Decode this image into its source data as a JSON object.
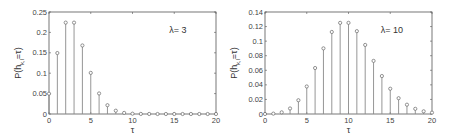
{
  "chart_data": [
    {
      "type": "stem",
      "title": "",
      "annotation": "λ= 3",
      "xlabel": "τ",
      "ylabel": "P(h_{k,l}=τ)",
      "ylabel_main": "P(h",
      "ylabel_sub": "k,l",
      "ylabel_tail": "=τ)",
      "xlim": [
        0,
        20
      ],
      "ylim": [
        0,
        0.25
      ],
      "xticks": [
        0,
        5,
        10,
        15,
        20
      ],
      "xtick_labels": [
        "0",
        "5",
        "10",
        "15",
        "20"
      ],
      "yticks": [
        0,
        0.05,
        0.1,
        0.15,
        0.2,
        0.25
      ],
      "ytick_labels": [
        "0",
        "0.05",
        "0.1",
        "0.15",
        "0.2",
        "0.25"
      ],
      "grid": false,
      "x": [
        0,
        1,
        2,
        3,
        4,
        5,
        6,
        7,
        8,
        9,
        10,
        11,
        12,
        13,
        14,
        15,
        16,
        17,
        18,
        19,
        20
      ],
      "values": [
        0.0498,
        0.1494,
        0.224,
        0.224,
        0.168,
        0.1008,
        0.0504,
        0.0216,
        0.0081,
        0.0027,
        0.0008,
        0.0002,
        0.0001,
        0.0,
        0.0,
        0.0,
        0.0,
        0.0,
        0.0,
        0.0,
        0.0
      ]
    },
    {
      "type": "stem",
      "title": "",
      "annotation": "λ= 10",
      "xlabel": "τ",
      "ylabel": "P(h_{k,l}=τ)",
      "ylabel_main": "P(h",
      "ylabel_sub": "k,l",
      "ylabel_tail": "=τ)",
      "xlim": [
        0,
        20
      ],
      "ylim": [
        0,
        0.14
      ],
      "xticks": [
        0,
        5,
        10,
        15,
        20
      ],
      "xtick_labels": [
        "0",
        "5",
        "10",
        "15",
        "20"
      ],
      "yticks": [
        0,
        0.02,
        0.04,
        0.06,
        0.08,
        0.1,
        0.12,
        0.14
      ],
      "ytick_labels": [
        "0",
        "0.02",
        "0.04",
        "0.06",
        "0.08",
        "0.1",
        "0.12",
        "0.14"
      ],
      "grid": false,
      "x": [
        0,
        1,
        2,
        3,
        4,
        5,
        6,
        7,
        8,
        9,
        10,
        11,
        12,
        13,
        14,
        15,
        16,
        17,
        18,
        19,
        20
      ],
      "values": [
        0.0,
        0.0005,
        0.0023,
        0.0076,
        0.0189,
        0.0378,
        0.0631,
        0.0901,
        0.1126,
        0.1251,
        0.1251,
        0.1137,
        0.0948,
        0.0729,
        0.0521,
        0.0347,
        0.0217,
        0.0128,
        0.0071,
        0.0037,
        0.0019
      ]
    }
  ],
  "style": {
    "stem_color": "#8a8a8a",
    "marker_color": "#666666",
    "axis_color": "#555555"
  }
}
